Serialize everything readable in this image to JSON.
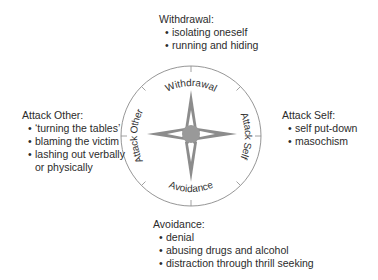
{
  "diagram": {
    "type": "compass",
    "colors": {
      "ring_stroke": "#8a8a8a",
      "star_fill": "#8c8c8c",
      "star_inner": "#ffffff",
      "hub_fill": "#999999",
      "text": "#2b2b2b"
    },
    "ring_labels": {
      "top": "Withdrawal",
      "right": "Attack Self",
      "bottom": "Avoidance",
      "left": "Attack Other"
    }
  },
  "blocks": {
    "withdrawal": {
      "title": "Withdrawal:",
      "items": [
        "isolating oneself",
        "running and hiding"
      ]
    },
    "attack_self": {
      "title": "Attack Self:",
      "items": [
        "self put-down",
        "masochism"
      ]
    },
    "attack_other": {
      "title": "Attack Other:",
      "items": [
        "‘turning the tables’",
        "blaming the victim",
        "lashing out verbally"
      ],
      "continuation": "or physically"
    },
    "avoidance": {
      "title": "Avoidance:",
      "items": [
        "denial",
        "abusing drugs and alcohol",
        "distraction through thrill seeking"
      ]
    }
  }
}
